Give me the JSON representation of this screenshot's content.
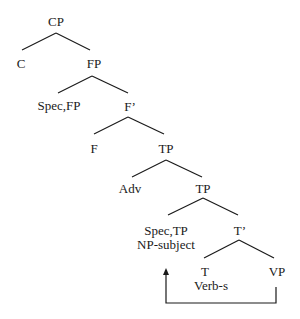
{
  "diagram": {
    "type": "syntax-tree",
    "nodes": [
      {
        "id": "cp",
        "label": "CP"
      },
      {
        "id": "c",
        "label": "C"
      },
      {
        "id": "fp",
        "label": "FP"
      },
      {
        "id": "spec_fp",
        "label": "Spec,FP"
      },
      {
        "id": "f_bar",
        "label": "F’"
      },
      {
        "id": "f",
        "label": "F"
      },
      {
        "id": "tp1",
        "label": "TP"
      },
      {
        "id": "adv",
        "label": "Adv"
      },
      {
        "id": "tp2",
        "label": "TP"
      },
      {
        "id": "spec_tp",
        "label": "Spec,TP"
      },
      {
        "id": "np_subject",
        "label": "NP-subject"
      },
      {
        "id": "t_bar",
        "label": "T’"
      },
      {
        "id": "t",
        "label": "T"
      },
      {
        "id": "verb_s",
        "label": "Verb-s"
      },
      {
        "id": "vp",
        "label": "VP"
      }
    ],
    "edges": [
      [
        "CP",
        "C"
      ],
      [
        "CP",
        "FP"
      ],
      [
        "FP",
        "Spec,FP"
      ],
      [
        "FP",
        "F’"
      ],
      [
        "F’",
        "F"
      ],
      [
        "F’",
        "TP"
      ],
      [
        "TP",
        "Adv"
      ],
      [
        "TP",
        "TP"
      ],
      [
        "TP",
        "Spec,TP"
      ],
      [
        "TP",
        "T’"
      ],
      [
        "T’",
        "T"
      ],
      [
        "T’",
        "VP"
      ]
    ],
    "movement_arrow": {
      "from": "VP",
      "to": "Spec,TP"
    }
  }
}
